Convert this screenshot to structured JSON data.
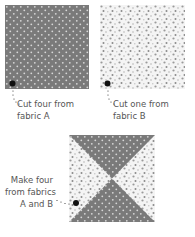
{
  "figure": {
    "pieces": [
      {
        "id": "fabric-a",
        "pattern": "dark-grey-with-white-dots",
        "label_line1": "Cut four from",
        "label_line2": "fabric A"
      },
      {
        "id": "fabric-b",
        "pattern": "light-scattered-grey-dots",
        "label_line1": "Cut one from",
        "label_line2": "fabric B"
      },
      {
        "id": "hourglass",
        "pattern": "hourglass-triangles-a-and-b",
        "label_line1": "Make four",
        "label_line2": "from fabrics",
        "label_line3": "A and B"
      }
    ]
  },
  "colors": {
    "fabric_a": "#7a7a7a",
    "fabric_a_dot": "#d8d8d8",
    "fabric_b_bg": "#f4f4f4",
    "fabric_b_dot": "#9a9a9a",
    "text": "#555555",
    "pointer": "#111111"
  }
}
